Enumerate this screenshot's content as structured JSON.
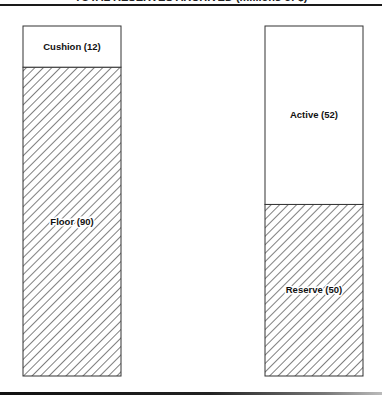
{
  "chart_data": {
    "type": "bar",
    "stacked": true,
    "title": "TOTAL RESERVES ARCHIVED (millions of $)",
    "xlabel": "",
    "ylabel": "",
    "ylim": [
      0,
      102
    ],
    "grid": false,
    "legend": "none",
    "bars": [
      {
        "name": "left",
        "segments": [
          {
            "label": "Floor (90)",
            "name": "Floor",
            "value": 90,
            "fill": "hatch"
          },
          {
            "label": "Cushion (12)",
            "name": "Cushion",
            "value": 12,
            "fill": "white"
          }
        ]
      },
      {
        "name": "right",
        "segments": [
          {
            "label": "Reserve (50)",
            "name": "Reserve",
            "value": 50,
            "fill": "hatch"
          },
          {
            "label": "Active (52)",
            "name": "Active",
            "value": 52,
            "fill": "white"
          }
        ]
      }
    ]
  },
  "colors": {
    "stroke": "#333333",
    "hatch": "#3a3a3a",
    "background": "#ffffff"
  }
}
